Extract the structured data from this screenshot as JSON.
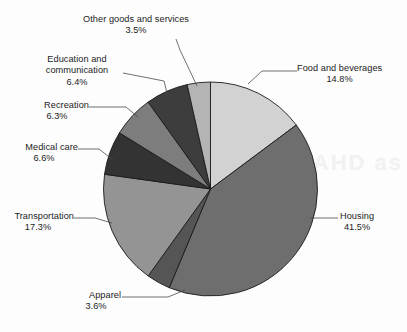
{
  "chart_data": {
    "type": "pie",
    "title": "",
    "subtitle": "",
    "xlabel": "",
    "ylabel": "",
    "legend_position": "callout-labels",
    "grid": false,
    "units": "percent",
    "start_angle_deg": 0,
    "direction": "clockwise",
    "categories": [
      "Food and beverages",
      "Housing",
      "Apparel",
      "Transportation",
      "Medical care",
      "Recreation",
      "Education and communication",
      "Other goods and services"
    ],
    "values": [
      14.8,
      41.5,
      3.6,
      17.3,
      6.6,
      6.3,
      6.4,
      3.5
    ],
    "value_labels": [
      "14.8%",
      "41.5%",
      "3.6%",
      "17.3%",
      "6.6%",
      "6.3%",
      "6.4%",
      "3.5%"
    ],
    "colors": [
      "#d2d2d2",
      "#6e6e6e",
      "#555555",
      "#949494",
      "#333333",
      "#7d7d7d",
      "#3d3d3d",
      "#b4b4b4"
    ],
    "slices": [
      {
        "label": "Food and beverages",
        "label_line1": "Food and beverages",
        "label_line2": "",
        "pct_text": "14.8%",
        "value": 14.8,
        "color": "#d2d2d2"
      },
      {
        "label": "Housing",
        "label_line1": "Housing",
        "label_line2": "",
        "pct_text": "41.5%",
        "value": 41.5,
        "color": "#6e6e6e"
      },
      {
        "label": "Apparel",
        "label_line1": "Apparel",
        "label_line2": "",
        "pct_text": "3.6%",
        "value": 3.6,
        "color": "#555555"
      },
      {
        "label": "Transportation",
        "label_line1": "Transportation",
        "label_line2": "",
        "pct_text": "17.3%",
        "value": 17.3,
        "color": "#949494"
      },
      {
        "label": "Medical care",
        "label_line1": "Medical care",
        "label_line2": "",
        "pct_text": "6.6%",
        "value": 6.6,
        "color": "#333333"
      },
      {
        "label": "Recreation",
        "label_line1": "Recreation",
        "label_line2": "",
        "pct_text": "6.3%",
        "value": 6.3,
        "color": "#7d7d7d"
      },
      {
        "label": "Education and communication",
        "label_line1": "Education and",
        "label_line2": "communication",
        "pct_text": "6.4%",
        "value": 6.4,
        "color": "#3d3d3d"
      },
      {
        "label": "Other goods and services",
        "label_line1": "Other goods and services",
        "label_line2": "",
        "pct_text": "3.5%",
        "value": 3.5,
        "color": "#b4b4b4"
      }
    ]
  },
  "background": {
    "bleed_text_1": "AHD as",
    "bleed_text_2": ""
  }
}
